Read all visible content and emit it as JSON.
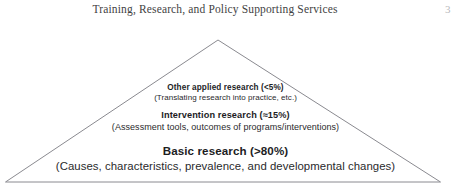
{
  "header": {
    "title": "Training, Research, and Policy Supporting Services",
    "page_marker": "3"
  },
  "figure": {
    "name": "research-pyramid",
    "shape": "triangle",
    "outline_color": "#8a8a90",
    "fill_color": "#ffffff",
    "tiers": [
      {
        "id": "applied",
        "heading": "Other applied research (<5%)",
        "subtitle": "(Translating research into practice, etc.)",
        "share_label": "<5%"
      },
      {
        "id": "intervention",
        "heading": "Intervention research (≈15%)",
        "subtitle": "(Assessment tools, outcomes of programs/interventions)",
        "share_label": "≈15%"
      },
      {
        "id": "basic",
        "heading": "Basic research (>80%)",
        "subtitle": "(Causes, characteristics, prevalence, and developmental changes)",
        "share_label": ">80%"
      }
    ]
  }
}
